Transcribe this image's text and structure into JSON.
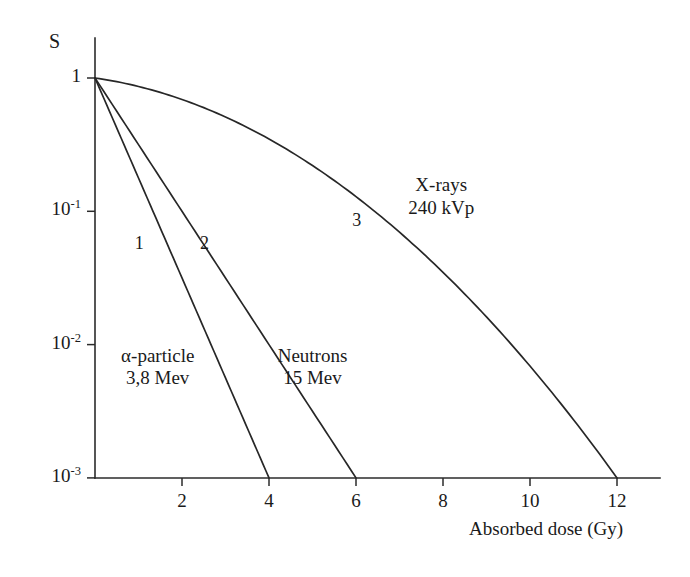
{
  "figure": {
    "width": 690,
    "height": 577,
    "background": "#ffffff",
    "ink_color": "#272727"
  },
  "chart_data": {
    "type": "line",
    "title": "",
    "subtitle": "",
    "xlabel": "Absorbed dose (Gy)",
    "ylabel": "S",
    "yscale": "log",
    "xscale": "linear",
    "xlim": [
      0,
      13
    ],
    "ylim": [
      0.001,
      1
    ],
    "xticks": [
      2,
      4,
      6,
      8,
      10,
      12
    ],
    "xtick_labels": [
      "2",
      "4",
      "6",
      "8",
      "10",
      "12"
    ],
    "yticks": [
      1,
      0.1,
      0.01,
      0.001
    ],
    "ytick_labels": [
      "1",
      "10⁻¹",
      "10⁻²",
      "10⁻³"
    ],
    "ytick_mantissa": [
      "1",
      "10",
      "10",
      "10"
    ],
    "ytick_exponent": [
      "",
      "-1",
      "-2",
      "-3"
    ],
    "grid": false,
    "legend": "inline-annotations",
    "series": [
      {
        "id": "curve-1",
        "number": "1",
        "name": "α-particle",
        "energy": "3,8 Mev",
        "shape": "exponential",
        "x_end": 4,
        "y_end": 0.001,
        "x": [
          0,
          0.5,
          1,
          1.5,
          2,
          2.5,
          3,
          3.5,
          4
        ],
        "y": [
          1,
          0.562,
          0.316,
          0.178,
          0.1,
          0.0562,
          0.0316,
          0.0178,
          0.001
        ]
      },
      {
        "id": "curve-2",
        "number": "2",
        "name": "Neutrons",
        "energy": "15 Mev",
        "shape": "exponential",
        "x_end": 6,
        "y_end": 0.001,
        "x": [
          0,
          0.75,
          1.5,
          2.25,
          3,
          3.75,
          4.5,
          5.25,
          6
        ],
        "y": [
          1,
          0.562,
          0.316,
          0.178,
          0.1,
          0.0562,
          0.0316,
          0.0178,
          0.001
        ]
      },
      {
        "id": "curve-3",
        "number": "3",
        "name": "X-rays",
        "energy": "240 kVp",
        "shape": "linear-quadratic-shoulder",
        "x_end": 12,
        "y_end": 0.001,
        "x": [
          0,
          1,
          2,
          3,
          4,
          5,
          6,
          7,
          8,
          9,
          10,
          11,
          12
        ],
        "y": [
          1,
          0.87,
          0.65,
          0.42,
          0.24,
          0.125,
          0.061,
          0.028,
          0.0125,
          0.0054,
          0.0023,
          0.00098,
          0.001
        ]
      }
    ],
    "annotations": [
      {
        "id": "ann-xrays",
        "text_line1": "X-rays",
        "text_line2": "240 kVp",
        "x": 7.2,
        "y": 0.13
      },
      {
        "id": "ann-alpha",
        "text_line1": "α-particle",
        "text_line2": "3,8 Mev",
        "x": 0.6,
        "y": 0.0068
      },
      {
        "id": "ann-neutrons",
        "text_line1": "Neutrons",
        "text_line2": "15 Mev",
        "x": 4.2,
        "y": 0.0068
      }
    ],
    "curve_number_labels": [
      {
        "id": "num-1",
        "text": "1",
        "x": 1.05,
        "y": 0.055
      },
      {
        "id": "num-2",
        "text": "2",
        "x": 2.55,
        "y": 0.055
      },
      {
        "id": "num-3",
        "text": "3",
        "x": 6.05,
        "y": 0.082
      }
    ]
  },
  "geometry": {
    "origin_x_px": 95,
    "origin_y_px": 78,
    "baseline_y_px": 478,
    "px_per_decade": 133.3,
    "px_per_unit_x": 43.5,
    "x_axis_right_px": 660,
    "y_axis_top_px": 38,
    "tick_len_px": 8
  }
}
